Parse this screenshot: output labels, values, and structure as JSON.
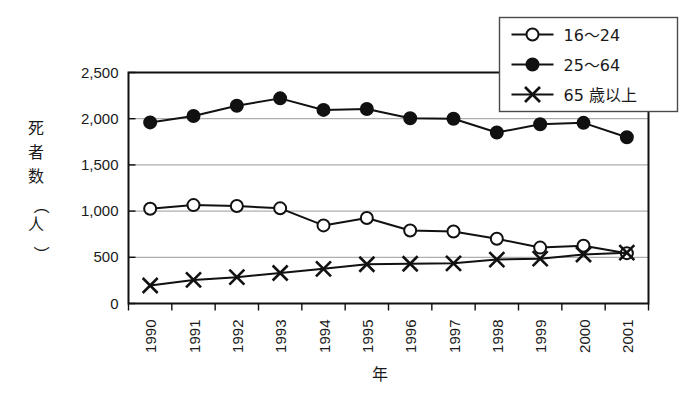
{
  "chart_data": {
    "type": "line",
    "title": "",
    "xlabel": "年",
    "ylabel": "死者数（人）",
    "categories": [
      "1990",
      "1991",
      "1992",
      "1993",
      "1994",
      "1995",
      "1996",
      "1997",
      "1998",
      "1999",
      "2000",
      "2001"
    ],
    "xlim": [
      1990,
      2001
    ],
    "ylim": [
      0,
      2500
    ],
    "ytick_labels": [
      "2,500",
      "2,000",
      "1,500",
      "1,000",
      "500",
      "0"
    ],
    "ytick_values": [
      2500,
      2000,
      1500,
      1000,
      500,
      0
    ],
    "grid": "horizontal",
    "legend_position": "top-right",
    "series": [
      {
        "name": "16〜24",
        "marker": "open-circle",
        "values": [
          1025,
          1065,
          1055,
          1030,
          845,
          925,
          790,
          780,
          700,
          605,
          625,
          545
        ]
      },
      {
        "name": "25〜64",
        "marker": "filled-circle",
        "values": [
          1960,
          2030,
          2140,
          2220,
          2095,
          2105,
          2005,
          2000,
          1850,
          1940,
          1955,
          1800
        ]
      },
      {
        "name": "65 歳以上",
        "marker": "cross-x",
        "values": [
          195,
          255,
          285,
          330,
          375,
          425,
          430,
          435,
          475,
          485,
          530,
          550
        ]
      }
    ]
  },
  "legend": {
    "items": [
      {
        "label": "16〜24",
        "marker": "open-circle"
      },
      {
        "label": "25〜64",
        "marker": "filled-circle"
      },
      {
        "label": "65 歳以上",
        "marker": "cross-x"
      }
    ]
  },
  "colors": {
    "background": "#ffffff",
    "ink": "#111111",
    "grid": "#9a9a9a",
    "legend_border": "#4a4a4a"
  }
}
